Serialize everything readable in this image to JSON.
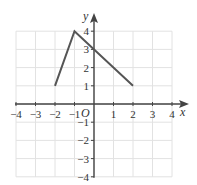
{
  "chart_data": {
    "type": "line",
    "title": "",
    "xlabel": "x",
    "ylabel": "y",
    "origin_label": "O",
    "xlim": [
      -4,
      4
    ],
    "ylim": [
      -4,
      4
    ],
    "grid": true,
    "x_ticks": [
      -4,
      -3,
      -2,
      -1,
      1,
      2,
      3,
      4
    ],
    "x_tick_labels": [
      "−4",
      "−3",
      "−2",
      "−1",
      "1",
      "2",
      "3",
      "4"
    ],
    "y_ticks": [
      4,
      3,
      2,
      1,
      -1,
      -2,
      -3,
      -4
    ],
    "y_tick_labels": [
      "4",
      "3",
      "2",
      "1",
      "−1",
      "−2",
      "−3",
      "−4"
    ],
    "series": [
      {
        "name": "graph",
        "points": [
          [
            -2,
            1
          ],
          [
            -1,
            4
          ],
          [
            2,
            1
          ]
        ],
        "color": "#555555"
      }
    ]
  },
  "colors": {
    "grid": "#e2e2e2",
    "axis": "#444444",
    "line": "#555555"
  }
}
